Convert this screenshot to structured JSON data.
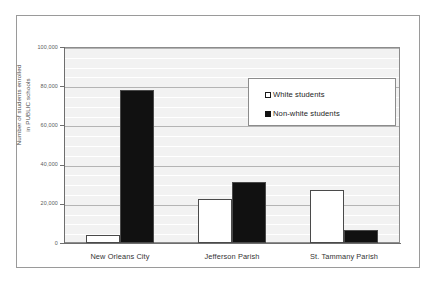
{
  "chart_data": {
    "type": "bar",
    "title": "",
    "xlabel": "",
    "ylabel_lines": [
      "Number of students enrolled",
      "in PUBLIC schools"
    ],
    "ylabel": "Number of students enrolled in PUBLIC schools",
    "categories": [
      "New Orleans City",
      "Jefferson Parish",
      "St. Tammany Parish"
    ],
    "series": [
      {
        "name": "White students",
        "values": [
          4000,
          22500,
          27000
        ],
        "color": "#ffffff",
        "edge_color": "#4a4a4a"
      },
      {
        "name": "Non-white students",
        "values": [
          78000,
          31000,
          6500
        ],
        "color": "#111111",
        "edge_color": "#4a4a4a"
      }
    ],
    "ylim": [
      0,
      100000
    ],
    "y_ticks": [
      0,
      20000,
      40000,
      60000,
      80000,
      100000
    ],
    "y_tick_labels": [
      "0",
      "20,000",
      "40,000",
      "60,000",
      "80,000",
      "100,000"
    ],
    "grid": true,
    "grid_minor_step": 5000,
    "legend_position": "upper right",
    "plot_background": "#f2f2f2",
    "figure_background": "#ffffff"
  },
  "legend": {
    "entries": [
      {
        "label": "White  students",
        "swatch": "white-square"
      },
      {
        "label": "Non-white  students",
        "swatch": "black-square"
      }
    ]
  }
}
